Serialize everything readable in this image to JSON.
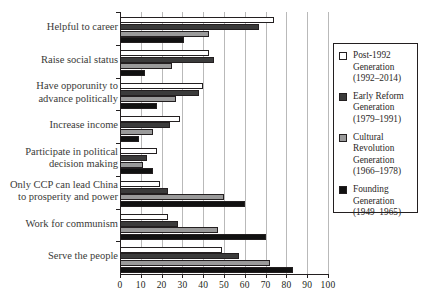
{
  "chart_data": {
    "type": "bar",
    "orientation": "horizontal",
    "title": "",
    "subtitle": "",
    "xlabel": "",
    "ylabel": "",
    "xlim": [
      0,
      100
    ],
    "xticks": [
      0,
      10,
      20,
      30,
      40,
      50,
      60,
      70,
      80,
      90,
      100
    ],
    "xtick_labels": [
      "0",
      "10",
      "20",
      "30",
      "40",
      "50",
      "60",
      "70",
      "80",
      "90",
      "100"
    ],
    "grid": "vertical",
    "legend_position": "right",
    "categories": [
      "Helpful to career",
      "Raise social status",
      "Have opporunity to advance politically",
      "Increase income",
      "Participate in political decision making",
      "Only CCP can lead China to prosperity and power",
      "Work for communism",
      "Serve the people"
    ],
    "category_lines": [
      [
        "Helpful to career"
      ],
      [
        "Raise social status"
      ],
      [
        "Have opporunity to",
        "advance politically"
      ],
      [
        "Increase income"
      ],
      [
        "Participate in political",
        "decision making"
      ],
      [
        "Only CCP can lead China",
        "to prosperity and power"
      ],
      [
        "Work for communism"
      ],
      [
        "Serve the people"
      ]
    ],
    "series": [
      {
        "name": "Post-1992 Generation (1992–2014)",
        "short_name": "Post-1992 Generation",
        "years": "(1992–2014)",
        "color": "#ffffff",
        "values": [
          74,
          43,
          40,
          29,
          18,
          19,
          23,
          49
        ]
      },
      {
        "name": "Early Reform Generation (1979–1991)",
        "short_name": "Early Reform Generation",
        "years": "(1979–1991)",
        "color": "#3b3b3b",
        "values": [
          67,
          45,
          38,
          24,
          13,
          23,
          28,
          57
        ]
      },
      {
        "name": "Cultural Revolution Generation (1966–1978)",
        "short_name": "Cultural Revolution Generation",
        "years": "(1966–1978)",
        "color": "#9a9a9a",
        "values": [
          43,
          25,
          27,
          16,
          11,
          50,
          47,
          72
        ]
      },
      {
        "name": "Founding Generation (1949–1965)",
        "short_name": "Founding Generation",
        "years": "(1949–1965)",
        "color": "#111111",
        "values": [
          31,
          12,
          18,
          9,
          16,
          60,
          70,
          83
        ]
      }
    ]
  },
  "legend": {
    "items": [
      {
        "swatch": "#ffffff",
        "lines": [
          "Post-1992",
          "Generation",
          "(1992–2014)"
        ]
      },
      {
        "swatch": "#3b3b3b",
        "lines": [
          "Early Reform",
          "Generation",
          "(1979–1991)"
        ]
      },
      {
        "swatch": "#9a9a9a",
        "lines": [
          "Cultural",
          "Revolution",
          "Generation",
          "(1966–1978)"
        ]
      },
      {
        "swatch": "#111111",
        "lines": [
          "Founding",
          "Generation",
          "(1949–1965)"
        ]
      }
    ]
  }
}
